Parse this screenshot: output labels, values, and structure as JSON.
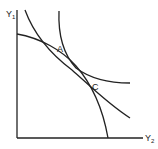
{
  "diagram": {
    "type": "economics-curves",
    "axes": {
      "y_label": "Y",
      "y_sub": "1",
      "x_label": "Y",
      "x_sub": "2"
    },
    "points": [
      {
        "id": "A",
        "label": "A"
      },
      {
        "id": "C",
        "label": "C"
      }
    ],
    "curves": [
      {
        "id": "concave-frontier",
        "shape": "concave to origin"
      },
      {
        "id": "convex-curve-steep",
        "shape": "convex to origin"
      },
      {
        "id": "convex-curve-through-A-C",
        "shape": "convex to origin"
      }
    ],
    "colors": {
      "line": "#222222",
      "background": "#ffffff"
    }
  }
}
